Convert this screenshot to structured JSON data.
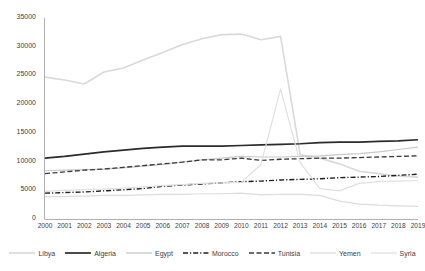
{
  "chart_data": {
    "type": "line",
    "title": "",
    "xlabel": "",
    "ylabel": "",
    "grid": false,
    "legend_position": "bottom",
    "ylim": [
      0,
      35000
    ],
    "ytick_values": [
      0,
      5000,
      10000,
      15000,
      20000,
      25000,
      30000,
      35000
    ],
    "ytick_labels": [
      "0",
      "5000",
      "10000",
      "15000",
      "20000",
      "25000",
      "30000",
      "35000"
    ],
    "categories": [
      "2000",
      "2001",
      "2002",
      "2003",
      "2004",
      "2005",
      "2006",
      "2007",
      "2008",
      "2009",
      "2010",
      "2011",
      "2012",
      "2013",
      "2014",
      "2015",
      "2016",
      "2017",
      "2018",
      "2019"
    ],
    "series": [
      {
        "name": "Libya",
        "color": "#d9d9d9",
        "style": "solid",
        "width": 1.6,
        "values": [
          24700,
          24200,
          23500,
          25600,
          26300,
          27700,
          29000,
          30400,
          31400,
          32100,
          32200,
          31200,
          31800,
          11200,
          10600,
          9600,
          8300,
          7900,
          7500,
          7300
        ]
      },
      {
        "name": "Algeria",
        "color": "#2b2b2b",
        "style": "solid",
        "width": 1.7,
        "values": [
          10600,
          10900,
          11300,
          11700,
          12000,
          12300,
          12500,
          12700,
          12700,
          12700,
          12800,
          12900,
          13000,
          13100,
          13300,
          13400,
          13400,
          13500,
          13600,
          13800
        ]
      },
      {
        "name": "Egypt",
        "color": "#c8c8c8",
        "style": "solid",
        "width": 1.2,
        "values": [
          8400,
          8500,
          8600,
          8700,
          8900,
          9200,
          9500,
          9900,
          10300,
          10600,
          10900,
          10800,
          10800,
          10900,
          11000,
          11200,
          11400,
          11700,
          12100,
          12500
        ]
      },
      {
        "name": "Morocco",
        "color": "#1f1f1f",
        "style": "dashdot",
        "width": 1.4,
        "values": [
          4500,
          4600,
          4700,
          4900,
          5100,
          5300,
          5700,
          5900,
          6100,
          6300,
          6500,
          6600,
          6800,
          6900,
          7000,
          7200,
          7300,
          7400,
          7600,
          7800
        ]
      },
      {
        "name": "Tunisia",
        "color": "#3a3a3a",
        "style": "dashed",
        "width": 1.3,
        "values": [
          7900,
          8200,
          8500,
          8700,
          9000,
          9300,
          9600,
          9900,
          10300,
          10300,
          10600,
          10200,
          10400,
          10500,
          10600,
          10600,
          10700,
          10800,
          10900,
          11000
        ]
      },
      {
        "name": "Yemen",
        "color": "#dcdcdc",
        "style": "solid",
        "width": 1.2,
        "values": [
          3900,
          3900,
          4000,
          4100,
          4100,
          4200,
          4300,
          4300,
          4400,
          4400,
          4500,
          4200,
          4300,
          4300,
          4100,
          3100,
          2600,
          2400,
          2300,
          2200
        ]
      },
      {
        "name": "Syria",
        "color": "#e0e0e0",
        "style": "solid",
        "width": 1.2,
        "values": [
          4800,
          5000,
          5100,
          5200,
          5400,
          5600,
          5800,
          6000,
          6200,
          6300,
          6400,
          9500,
          22600,
          9800,
          5300,
          4900,
          6200,
          6500,
          6600,
          6700
        ]
      }
    ]
  },
  "axes": {
    "x_first_label": "2000",
    "x_last_label": "2019",
    "y_max_label": "35000",
    "y_min_label": "0"
  },
  "legend": {
    "items": [
      {
        "label": "Libya"
      },
      {
        "label": "Algeria"
      },
      {
        "label": "Egypt"
      },
      {
        "label": "Morocco"
      },
      {
        "label": "Tunisia"
      },
      {
        "label": "Yemen"
      },
      {
        "label": "Syria"
      }
    ]
  }
}
